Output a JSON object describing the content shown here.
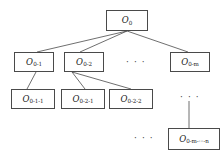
{
  "diagram": {
    "background_color": "#ffffff",
    "box_border_color": "#4a4a4a",
    "edge_color": "#4a4a4a",
    "text_color": "#1a1a1a",
    "levels": 4,
    "nodes": [
      {
        "id": "root",
        "base": "O",
        "subscript": "0",
        "label": "O0",
        "level": 1,
        "x": 106,
        "y": 10,
        "w": 42,
        "h": 21
      },
      {
        "id": "n-0-1",
        "base": "O",
        "subscript": "0-1",
        "label": "O0-1",
        "level": 2,
        "x": 14,
        "y": 52,
        "w": 40,
        "h": 20
      },
      {
        "id": "n-0-2",
        "base": "O",
        "subscript": "0-2",
        "label": "O0-2",
        "level": 2,
        "x": 64,
        "y": 52,
        "w": 40,
        "h": 20
      },
      {
        "id": "n-0-m",
        "base": "O",
        "subscript": "0-m",
        "label": "O0-m",
        "level": 2,
        "x": 170,
        "y": 52,
        "w": 40,
        "h": 20
      },
      {
        "id": "n-0-1-1",
        "base": "O",
        "subscript": "0-1-1",
        "label": "O0-1-1",
        "level": 3,
        "x": 11,
        "y": 89,
        "w": 44,
        "h": 20
      },
      {
        "id": "n-0-2-1",
        "base": "O",
        "subscript": "0-2-1",
        "label": "O0-2-1",
        "level": 3,
        "x": 61,
        "y": 89,
        "w": 44,
        "h": 20
      },
      {
        "id": "n-0-2-2",
        "base": "O",
        "subscript": "0-2-2",
        "label": "O0-2-2",
        "level": 3,
        "x": 109,
        "y": 89,
        "w": 44,
        "h": 20
      },
      {
        "id": "n-0-m-n",
        "base": "O",
        "subscript": "0-m-···-n",
        "label": "O0-m-···-n",
        "level": 4,
        "x": 168,
        "y": 128,
        "w": 52,
        "h": 22
      }
    ],
    "ellipses": [
      {
        "id": "ellipsis-level2",
        "text": "· · ·",
        "x": 126,
        "y": 58
      },
      {
        "id": "ellipsis-level3-right",
        "text": "· · ·",
        "x": 180,
        "y": 93
      },
      {
        "id": "ellipsis-level4-left",
        "text": "· · ·",
        "x": 134,
        "y": 134
      }
    ],
    "edges": [
      {
        "id": "edge-root-to-0-1",
        "from": "root",
        "to": "n-0-1",
        "x1": 127,
        "y1": 31,
        "x2": 37,
        "y2": 52
      },
      {
        "id": "edge-root-to-0-2",
        "from": "root",
        "to": "n-0-2",
        "x1": 127,
        "y1": 31,
        "x2": 80,
        "y2": 52
      },
      {
        "id": "edge-root-to-0-m",
        "from": "root",
        "to": "n-0-m",
        "x1": 127,
        "y1": 31,
        "x2": 188,
        "y2": 52
      },
      {
        "id": "edge-0-1-to-0-1-1",
        "from": "n-0-1",
        "to": "n-0-1-1",
        "x1": 36,
        "y1": 72,
        "x2": 27,
        "y2": 89
      },
      {
        "id": "edge-0-2-to-0-2-1",
        "from": "n-0-2",
        "to": "n-0-2-1",
        "x1": 72,
        "y1": 72,
        "x2": 85,
        "y2": 89
      },
      {
        "id": "edge-0-2-to-0-2-2",
        "from": "n-0-2",
        "to": "n-0-2-2",
        "x1": 72,
        "y1": 72,
        "x2": 131,
        "y2": 89
      },
      {
        "id": "edge-ellipsis-to-0-m-n",
        "from": "ellipsis-level3-right",
        "to": "n-0-m-n",
        "x1": 189,
        "y1": 101,
        "x2": 189,
        "y2": 128
      }
    ]
  }
}
